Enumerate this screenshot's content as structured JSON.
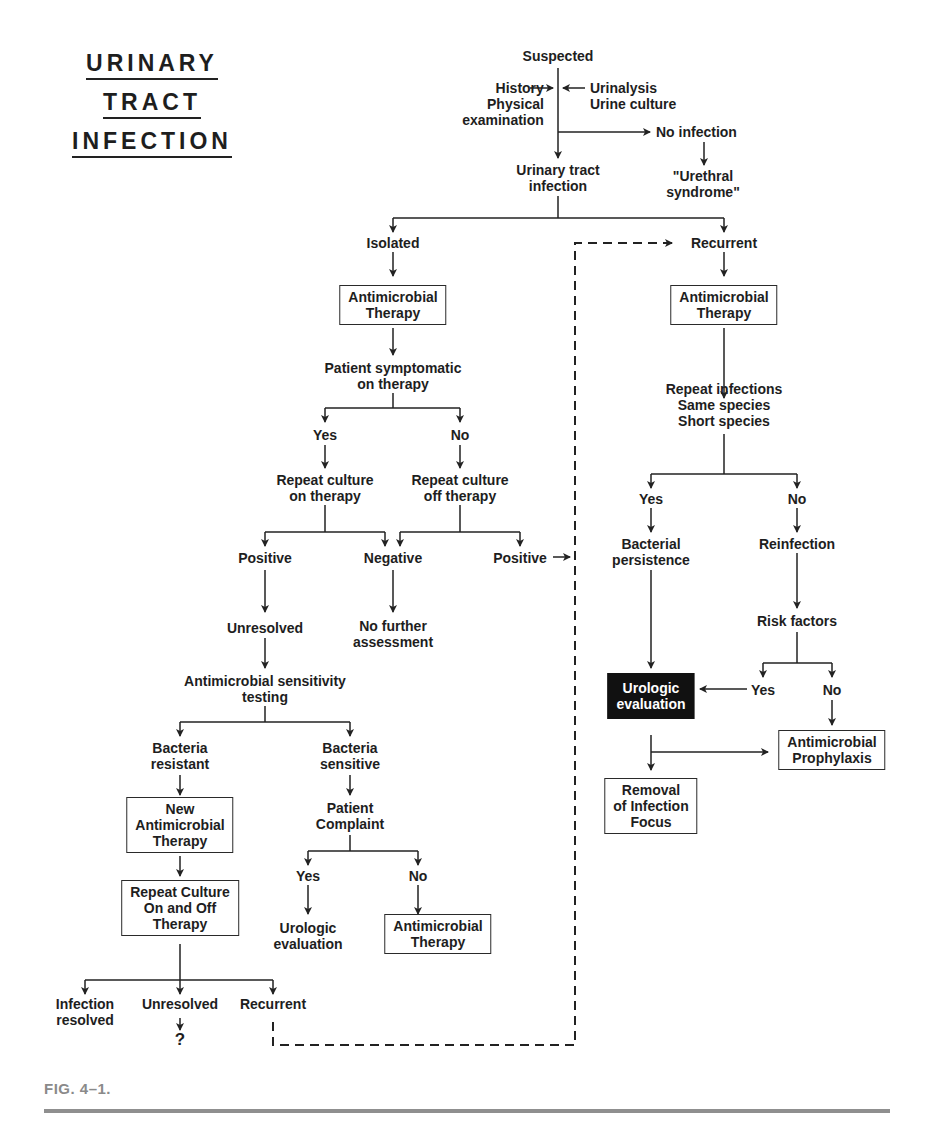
{
  "title": {
    "line1": "URINARY",
    "line2": "TRACT",
    "line3": "INFECTION"
  },
  "caption": "FIG. 4–1.",
  "nodes": {
    "suspected": "Suspected",
    "history": "History\nPhysical\nexamination",
    "urinalysis": "Urinalysis\nUrine culture",
    "no_infection": "No infection",
    "urethral": "\"Urethral\nsyndrome\"",
    "uti": "Urinary tract\ninfection",
    "isolated": "Isolated",
    "recurrent_top": "Recurrent",
    "amt_left": "Antimicrobial\nTherapy",
    "amt_right": "Antimicrobial\nTherapy",
    "patient_symptomatic": "Patient symptomatic\non therapy",
    "yes1": "Yes",
    "no1": "No",
    "repeat_on": "Repeat culture\non therapy",
    "repeat_off": "Repeat culture\noff therapy",
    "positive1": "Positive",
    "negative": "Negative",
    "positive2": "Positive",
    "unresolved1": "Unresolved",
    "no_further": "No further\nassessment",
    "sensitivity": "Antimicrobial sensitivity\ntesting",
    "resistant": "Bacteria\nresistant",
    "sensitive": "Bacteria\nsensitive",
    "new_amt": "New\nAntimicrobial\nTherapy",
    "patient_complaint": "Patient\nComplaint",
    "yes2": "Yes",
    "no2": "No",
    "urologic_eval_left": "Urologic\nevaluation",
    "amt_bottom": "Antimicrobial\nTherapy",
    "repeat_onoff": "Repeat Culture\nOn and Off\nTherapy",
    "infection_resolved": "Infection\nresolved",
    "unresolved2": "Unresolved",
    "question": "?",
    "recurrent_bottom": "Recurrent",
    "repeat_infections": "Repeat infections\nSame species\nShort species",
    "yes3": "Yes",
    "no3": "No",
    "bacterial_persistence": "Bacterial\npersistence",
    "reinfection": "Reinfection",
    "risk_factors": "Risk factors",
    "yes4": "Yes",
    "no4": "No",
    "urologic_eval_dark": "Urologic\nevaluation",
    "prophylaxis": "Antimicrobial\nProphylaxis",
    "removal": "Removal\nof Infection\nFocus"
  },
  "colors": {
    "ink": "#1e1e1e",
    "dark_box": "#111111",
    "caption": "#8a8a8a",
    "rule": "#8f8f8f"
  }
}
